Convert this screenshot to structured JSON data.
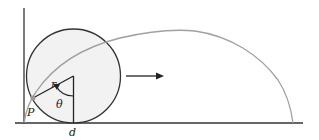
{
  "diagram": {
    "labels": {
      "radius": "r",
      "angle": "θ",
      "point": "P",
      "distance": "d"
    },
    "colors": {
      "background": "#ffffff",
      "axes": "#333333",
      "circle": "#333333",
      "circle_fill": "#f2f2f2",
      "cycloid": "#a0a0a0",
      "point": "#999999"
    },
    "geometry": {
      "origin": [
        24,
        123
      ],
      "circle_center": [
        73.5,
        76
      ],
      "circle_radius": 47,
      "point_P": [
        33,
        98
      ],
      "cycloid_end_x": 293,
      "arrow": {
        "from": [
          126,
          76
        ],
        "to": [
          164,
          76
        ]
      }
    }
  }
}
